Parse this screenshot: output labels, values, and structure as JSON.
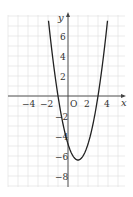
{
  "chart_data": {
    "type": "line",
    "title": "",
    "xlabel": "x",
    "ylabel": "y",
    "origin_label": "O",
    "xlim": [
      -6,
      6
    ],
    "ylim": [
      -9,
      8
    ],
    "grid": true,
    "x_ticks": [
      "−4",
      "−2",
      "2",
      "4"
    ],
    "y_ticks": [
      "6",
      "4",
      "2",
      "−2",
      "−4",
      "−6",
      "−8"
    ],
    "series": [
      {
        "name": "parabola",
        "equation_estimate": "y ≈ 1.6(x+1)(x−3)",
        "x_intercepts": [
          -1,
          3
        ],
        "vertex": [
          1,
          -6.5
        ],
        "points": [
          [
            -1.9,
            8
          ],
          [
            -1,
            0
          ],
          [
            0,
            -4.8
          ],
          [
            1,
            -6.5
          ],
          [
            2,
            -4.8
          ],
          [
            3,
            0
          ],
          [
            3.9,
            8
          ]
        ]
      }
    ]
  }
}
